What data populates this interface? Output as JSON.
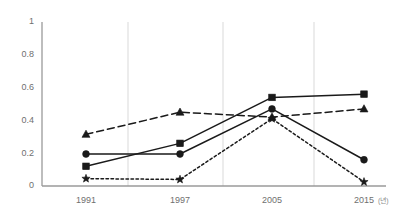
{
  "chart_data": {
    "type": "line",
    "title": "",
    "subtitle": "",
    "xlabel": "",
    "ylabel": "",
    "x_unit_note": "(년)",
    "categories": [
      "1991",
      "1997",
      "2005",
      "2015"
    ],
    "xtick_labels": [
      "1991",
      "1997",
      "2005",
      "2015"
    ],
    "ytick_labels": [
      "0",
      "0.2",
      "0.4",
      "0.6",
      "0.8",
      "1"
    ],
    "ytick_values": [
      0,
      0.2,
      0.4,
      0.6,
      0.8,
      1
    ],
    "ylim": [
      0,
      1
    ],
    "grid": "vertical-only",
    "legend": "none",
    "legend_position": "none",
    "series": [
      {
        "name": "series-square",
        "marker": "square",
        "line_style": "solid",
        "color": "#1a1a1a",
        "values": [
          0.12,
          0.26,
          0.54,
          0.56
        ]
      },
      {
        "name": "series-circle",
        "marker": "circle",
        "line_style": "solid",
        "color": "#1a1a1a",
        "values": [
          0.195,
          0.195,
          0.47,
          0.16
        ]
      },
      {
        "name": "series-triangle",
        "marker": "triangle",
        "line_style": "dashed",
        "color": "#1a1a1a",
        "values": [
          0.315,
          0.45,
          0.42,
          0.47
        ]
      },
      {
        "name": "series-star",
        "marker": "star",
        "line_style": "dotted",
        "color": "#1a1a1a",
        "values": [
          0.045,
          0.04,
          0.41,
          0.025
        ]
      }
    ]
  }
}
